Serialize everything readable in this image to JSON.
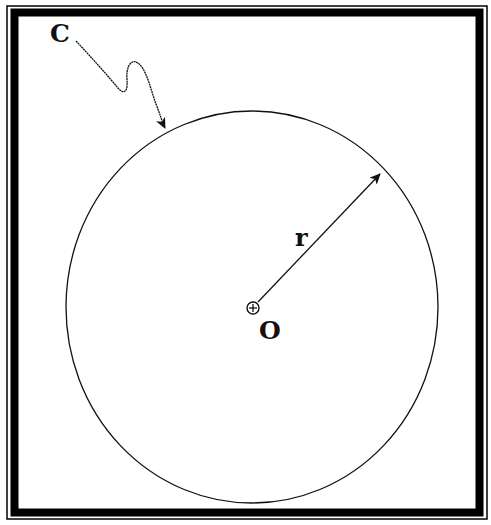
{
  "diagram": {
    "type": "geometry-circle",
    "labels": {
      "curve": "C",
      "radius": "r",
      "center": "O"
    },
    "circle": {
      "cx": 252,
      "cy": 307,
      "rx": 186,
      "ry": 196
    },
    "center_marker": {
      "cx": 253,
      "cy": 308,
      "r": 6,
      "glyph": "circle-plus"
    },
    "radius_arrow": {
      "from": [
        253,
        308
      ],
      "to": [
        382,
        172
      ]
    },
    "curve_pointer": {
      "start": [
        76,
        40
      ],
      "tip": [
        166,
        130
      ]
    },
    "colors": {
      "stroke": "#111111",
      "background": "#ffffff",
      "frame": "#000000"
    }
  }
}
